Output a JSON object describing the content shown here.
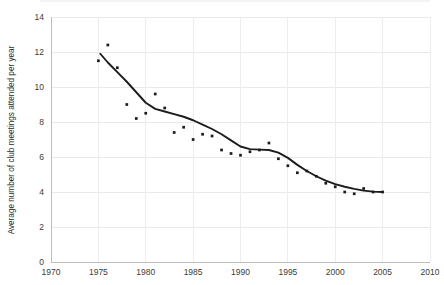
{
  "chart_data": {
    "type": "scatter",
    "title": "",
    "xlabel": "",
    "ylabel": "Average number of club meetings attended per year",
    "xlim": [
      1970,
      2010
    ],
    "ylim": [
      0,
      14
    ],
    "xticks": [
      1970,
      1975,
      1980,
      1985,
      1990,
      1995,
      2000,
      2005,
      2010
    ],
    "yticks": [
      0,
      2,
      4,
      6,
      8,
      10,
      12,
      14
    ],
    "grid": true,
    "legend": "none",
    "x": [
      1975,
      1976,
      1977,
      1978,
      1979,
      1980,
      1981,
      1982,
      1983,
      1984,
      1985,
      1986,
      1987,
      1988,
      1989,
      1990,
      1991,
      1992,
      1993,
      1994,
      1995,
      1996,
      1997,
      1998,
      1999,
      2000,
      2001,
      2002,
      2003,
      2004,
      2005
    ],
    "values": [
      11.5,
      12.4,
      11.1,
      9.0,
      8.2,
      8.5,
      9.6,
      8.8,
      7.4,
      7.7,
      7.0,
      7.3,
      7.2,
      6.4,
      6.2,
      6.1,
      6.3,
      6.4,
      6.8,
      5.9,
      5.5,
      5.1,
      5.2,
      4.9,
      4.5,
      4.3,
      4.0,
      3.9,
      4.2,
      4.0,
      4.0
    ],
    "series": [
      {
        "name": "Observed averages",
        "marker": "filled-square",
        "values": [
          11.5,
          12.4,
          11.1,
          9.0,
          8.2,
          8.5,
          9.6,
          8.8,
          7.4,
          7.7,
          7.0,
          7.3,
          7.2,
          6.4,
          6.2,
          6.1,
          6.3,
          6.4,
          6.8,
          5.9,
          5.5,
          5.1,
          5.2,
          4.9,
          4.5,
          4.3,
          4.0,
          3.9,
          4.2,
          4.0,
          4.0
        ]
      },
      {
        "name": "Smoothed trend",
        "type": "line",
        "x": [
          1975.2,
          1976,
          1977,
          1978,
          1979,
          1980,
          1981,
          1982,
          1983,
          1984,
          1985,
          1986,
          1987,
          1988,
          1989,
          1990,
          1991,
          1992,
          1993,
          1994,
          1995,
          1996,
          1997,
          1998,
          1999,
          2000,
          2001,
          2002,
          2003,
          2004,
          2005
        ],
        "values": [
          11.9,
          11.4,
          10.85,
          10.3,
          9.7,
          9.1,
          8.75,
          8.6,
          8.45,
          8.3,
          8.1,
          7.85,
          7.6,
          7.3,
          6.95,
          6.6,
          6.45,
          6.42,
          6.4,
          6.25,
          5.95,
          5.55,
          5.2,
          4.9,
          4.65,
          4.45,
          4.3,
          4.18,
          4.08,
          4.02,
          4.0
        ]
      }
    ]
  },
  "axes": {
    "y_label": "Average number of club meetings attended per year",
    "y_tick_labels": [
      "0",
      "2",
      "4",
      "6",
      "8",
      "10",
      "12",
      "14"
    ],
    "x_tick_labels": [
      "1970",
      "1975",
      "1980",
      "1985",
      "1990",
      "1995",
      "2000",
      "2005",
      "2010"
    ]
  }
}
